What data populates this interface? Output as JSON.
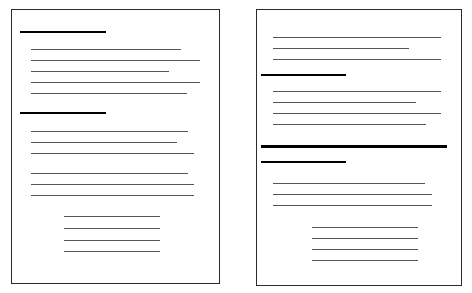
{
  "canvas": {
    "width": 472,
    "height": 293,
    "background": "#ffffff"
  },
  "colors": {
    "page_border": "#2b2b2b",
    "page_background": "#ffffff",
    "body_rule": "#555555",
    "heading_rule": "#000000",
    "bar_rule": "#000000"
  },
  "document": {
    "type": "two-page-spread-thumbnail",
    "page_count": 2,
    "description": "Two bordered document page thumbnails with abstracted text rendered as horizontal rules"
  },
  "pages": [
    {
      "id": "page-left",
      "name": "left-page",
      "label": "Left page",
      "rect": {
        "x": 11,
        "y": 9,
        "width": 209,
        "height": 275
      },
      "lines": [
        {
          "name": "heading-1",
          "kind": "heading",
          "x": 20,
          "y": 31,
          "width": 86,
          "thickness": 2
        },
        {
          "name": "body-line-1",
          "kind": "body",
          "x": 31,
          "y": 49,
          "width": 150,
          "thickness": 1
        },
        {
          "name": "body-line-2",
          "kind": "body",
          "x": 31,
          "y": 60,
          "width": 169,
          "thickness": 1
        },
        {
          "name": "body-line-3",
          "kind": "body",
          "x": 31,
          "y": 71,
          "width": 138,
          "thickness": 1
        },
        {
          "name": "body-line-4",
          "kind": "body",
          "x": 31,
          "y": 82,
          "width": 169,
          "thickness": 1
        },
        {
          "name": "body-line-5",
          "kind": "body",
          "x": 31,
          "y": 93,
          "width": 156,
          "thickness": 1
        },
        {
          "name": "heading-2",
          "kind": "heading",
          "x": 20,
          "y": 112,
          "width": 86,
          "thickness": 2
        },
        {
          "name": "body-line-6",
          "kind": "body",
          "x": 31,
          "y": 131,
          "width": 157,
          "thickness": 1
        },
        {
          "name": "body-line-7",
          "kind": "body",
          "x": 31,
          "y": 142,
          "width": 146,
          "thickness": 1
        },
        {
          "name": "body-line-8",
          "kind": "body",
          "x": 31,
          "y": 153,
          "width": 163,
          "thickness": 1
        },
        {
          "name": "body-line-9",
          "kind": "body",
          "x": 31,
          "y": 173,
          "width": 157,
          "thickness": 1
        },
        {
          "name": "body-line-10",
          "kind": "body",
          "x": 31,
          "y": 184,
          "width": 163,
          "thickness": 1
        },
        {
          "name": "body-line-11",
          "kind": "body",
          "x": 31,
          "y": 195,
          "width": 163,
          "thickness": 1
        },
        {
          "name": "indent-line-1",
          "kind": "body",
          "x": 64,
          "y": 216,
          "width": 96,
          "thickness": 1
        },
        {
          "name": "indent-line-2",
          "kind": "body",
          "x": 64,
          "y": 228,
          "width": 96,
          "thickness": 1
        },
        {
          "name": "indent-line-3",
          "kind": "body",
          "x": 64,
          "y": 240,
          "width": 96,
          "thickness": 1
        },
        {
          "name": "indent-line-4",
          "kind": "body",
          "x": 64,
          "y": 251,
          "width": 96,
          "thickness": 1
        }
      ]
    },
    {
      "id": "page-right",
      "name": "right-page",
      "label": "Right page",
      "rect": {
        "x": 256,
        "y": 9,
        "width": 206,
        "height": 277
      },
      "lines": [
        {
          "name": "body-line-1",
          "kind": "body",
          "x": 273,
          "y": 37,
          "width": 168,
          "thickness": 1
        },
        {
          "name": "body-line-2",
          "kind": "body",
          "x": 273,
          "y": 48,
          "width": 136,
          "thickness": 1
        },
        {
          "name": "body-line-3",
          "kind": "body",
          "x": 273,
          "y": 59,
          "width": 168,
          "thickness": 1
        },
        {
          "name": "heading-1",
          "kind": "heading",
          "x": 261,
          "y": 74,
          "width": 85,
          "thickness": 2
        },
        {
          "name": "body-line-4",
          "kind": "body",
          "x": 273,
          "y": 91,
          "width": 168,
          "thickness": 1
        },
        {
          "name": "body-line-5",
          "kind": "body",
          "x": 273,
          "y": 102,
          "width": 143,
          "thickness": 1
        },
        {
          "name": "body-line-6",
          "kind": "body",
          "x": 273,
          "y": 113,
          "width": 168,
          "thickness": 1
        },
        {
          "name": "body-line-7",
          "kind": "body",
          "x": 273,
          "y": 124,
          "width": 153,
          "thickness": 1
        },
        {
          "name": "emphasis-bar",
          "kind": "bar",
          "x": 261,
          "y": 145,
          "width": 186,
          "thickness": 3
        },
        {
          "name": "heading-2",
          "kind": "heading",
          "x": 261,
          "y": 161,
          "width": 85,
          "thickness": 2
        },
        {
          "name": "body-line-8",
          "kind": "body",
          "x": 273,
          "y": 183,
          "width": 152,
          "thickness": 1
        },
        {
          "name": "body-line-9",
          "kind": "body",
          "x": 273,
          "y": 194,
          "width": 159,
          "thickness": 1
        },
        {
          "name": "body-line-10",
          "kind": "body",
          "x": 273,
          "y": 205,
          "width": 159,
          "thickness": 1
        },
        {
          "name": "indent-line-1",
          "kind": "body",
          "x": 312,
          "y": 227,
          "width": 106,
          "thickness": 1
        },
        {
          "name": "indent-line-2",
          "kind": "body",
          "x": 312,
          "y": 238,
          "width": 106,
          "thickness": 1
        },
        {
          "name": "indent-line-3",
          "kind": "body",
          "x": 312,
          "y": 249,
          "width": 106,
          "thickness": 1
        },
        {
          "name": "indent-line-4",
          "kind": "body",
          "x": 312,
          "y": 260,
          "width": 106,
          "thickness": 1
        }
      ]
    }
  ]
}
